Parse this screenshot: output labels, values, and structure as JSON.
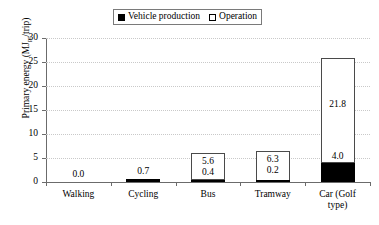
{
  "chart_data": {
    "type": "bar",
    "subtype": "stacked",
    "title": "",
    "xlabel": "",
    "ylabel": "Primary energy (MJpr/trip)",
    "ylabel_prefix": "Primary energy (MJ",
    "ylabel_subscript": "pr",
    "ylabel_suffix": "/trip)",
    "categories": [
      "Walking",
      "Cycling",
      "Bus",
      "Tramway",
      "Car (Golf\ntype)"
    ],
    "category_labels": [
      "Walking",
      "Cycling",
      "Bus",
      "Tramway",
      "Car (Golf type)"
    ],
    "series": [
      {
        "name": "Vehicle production",
        "color": "#000000",
        "values": [
          0.0,
          0.7,
          0.4,
          0.2,
          4.0
        ],
        "value_labels": [
          "0.0",
          "0.7",
          "0.4",
          "0.2",
          "4.0"
        ]
      },
      {
        "name": "Operation",
        "color": "#ffffff",
        "values": [
          0.0,
          0.0,
          5.6,
          6.3,
          21.8
        ],
        "value_labels": [
          "",
          "",
          "5.6",
          "6.3",
          "21.8"
        ]
      }
    ],
    "totals": [
      0.0,
      0.7,
      6.0,
      6.5,
      25.8
    ],
    "ylim": [
      0,
      30
    ],
    "yticks": [
      0,
      5,
      10,
      15,
      20,
      25,
      30
    ],
    "ytick_labels": [
      "0",
      "5",
      "10",
      "15",
      "20",
      "25",
      "30"
    ],
    "grid": true,
    "grid_style": "dotted",
    "grid_color": "#c9c9c9",
    "legend_position": "top-center",
    "legend_entries": [
      {
        "label": "Vehicle production",
        "marker": "filled-square",
        "color": "#000000"
      },
      {
        "label": "Operation",
        "marker": "open-square",
        "color": "#ffffff"
      }
    ],
    "axis_color": "#6b6b6b",
    "background": "#ffffff"
  }
}
